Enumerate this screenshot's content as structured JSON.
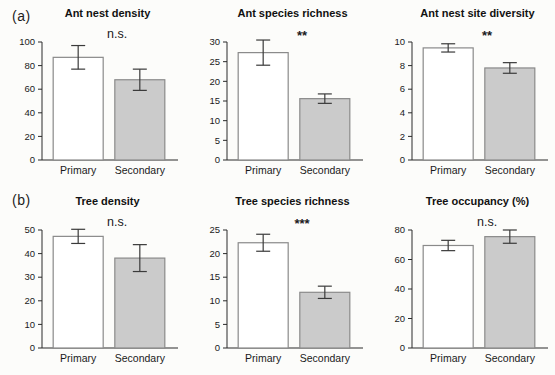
{
  "figure": {
    "panel_a_label": "(a)",
    "panel_b_label": "(b)",
    "colors": {
      "primary_bar_fill": "#ffffff",
      "secondary_bar_fill": "#cbcbcb",
      "bar_stroke": "#8a8a8a",
      "axis_stroke": "#2a2a2a",
      "error_stroke": "#3a3a3a",
      "background": "#fcfcfa"
    }
  },
  "chart_data": [
    {
      "type": "bar",
      "title": "Ant nest density",
      "categories": [
        "Primary",
        "Secondary"
      ],
      "values": [
        87,
        68
      ],
      "errors": [
        10,
        9
      ],
      "significance": "n.s.",
      "ylabel": "",
      "ylim": [
        0,
        100
      ],
      "yticks": [
        0,
        20,
        40,
        60,
        80,
        100
      ],
      "legend": "none",
      "grid": "off"
    },
    {
      "type": "bar",
      "title": "Ant species richness",
      "categories": [
        "Primary",
        "Secondary"
      ],
      "values": [
        27.3,
        15.6
      ],
      "errors": [
        3.2,
        1.2
      ],
      "significance": "**",
      "ylabel": "",
      "ylim": [
        0,
        30
      ],
      "yticks": [
        0,
        5,
        10,
        15,
        20,
        25,
        30
      ],
      "legend": "none",
      "grid": "off"
    },
    {
      "type": "bar",
      "title": "Ant nest site diversity",
      "categories": [
        "Primary",
        "Secondary"
      ],
      "values": [
        9.5,
        7.8
      ],
      "errors": [
        0.35,
        0.45
      ],
      "significance": "**",
      "ylabel": "",
      "ylim": [
        0,
        10
      ],
      "yticks": [
        0,
        2,
        4,
        6,
        8,
        10
      ],
      "legend": "none",
      "grid": "off"
    },
    {
      "type": "bar",
      "title": "Tree density",
      "categories": [
        "Primary",
        "Secondary"
      ],
      "values": [
        47.3,
        38.1
      ],
      "errors": [
        3.0,
        5.7
      ],
      "significance": "n.s.",
      "ylabel": "",
      "ylim": [
        0,
        50
      ],
      "yticks": [
        0,
        10,
        20,
        30,
        40,
        50
      ],
      "legend": "none",
      "grid": "off"
    },
    {
      "type": "bar",
      "title": "Tree species richness",
      "categories": [
        "Primary",
        "Secondary"
      ],
      "values": [
        22.3,
        11.8
      ],
      "errors": [
        1.8,
        1.3
      ],
      "significance": "***",
      "ylabel": "",
      "ylim": [
        0,
        25
      ],
      "yticks": [
        0,
        5,
        10,
        15,
        20,
        25
      ],
      "legend": "none",
      "grid": "off"
    },
    {
      "type": "bar",
      "title": "Tree occupancy (%)",
      "categories": [
        "Primary",
        "Secondary"
      ],
      "values": [
        69.5,
        75.5
      ],
      "errors": [
        3.5,
        4.5
      ],
      "significance": "n.s.",
      "ylabel": "",
      "ylim": [
        0,
        80
      ],
      "yticks": [
        0,
        20,
        40,
        60,
        80
      ],
      "legend": "none",
      "grid": "off"
    }
  ]
}
